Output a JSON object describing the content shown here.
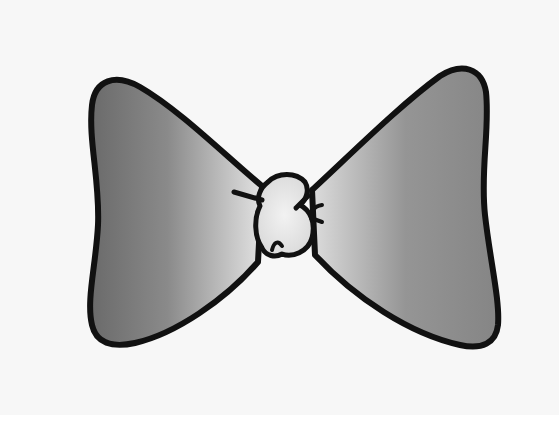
{
  "image": {
    "subject": "bow tie illustration",
    "description": "Black-outlined gray gradient bow tie with a light knot in the center, on a white paper background",
    "colors": {
      "background": "#f7f7f7",
      "page_edge": "#ffffff",
      "outline": "#111111",
      "wing_dark": "#6e6e6e",
      "wing_light": "#d9d9d9",
      "knot_fill": "#eeeeee"
    }
  }
}
